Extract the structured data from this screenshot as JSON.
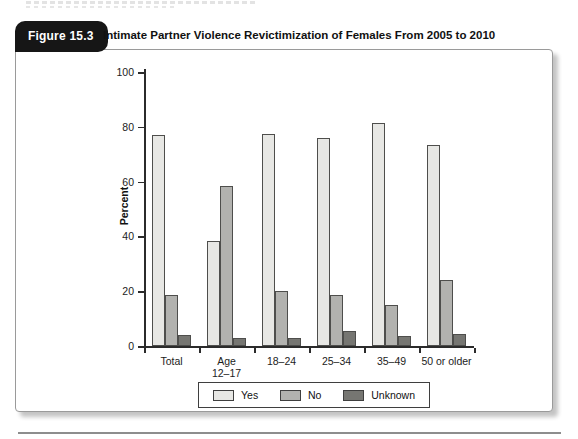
{
  "figure": {
    "label": "Figure 15.3",
    "title": "Intimate Partner Violence Revictimization of Females From 2005 to 2010"
  },
  "chart_data": {
    "type": "bar",
    "title": "Intimate Partner Violence Revictimization of Females From 2005 to 2010",
    "categories": [
      "Total",
      "Age 12–17",
      "18–24",
      "25–34",
      "35–49",
      "50 or older"
    ],
    "category_lines": [
      [
        "Total"
      ],
      [
        "Age",
        "12–17"
      ],
      [
        "18–24"
      ],
      [
        "25–34"
      ],
      [
        "35–49"
      ],
      [
        "50 or older"
      ]
    ],
    "series": [
      {
        "name": "Yes",
        "color": "#e7e7e4",
        "values": [
          77,
          38.5,
          77.5,
          76,
          81.5,
          73.5
        ]
      },
      {
        "name": "No",
        "color": "#b2b2af",
        "values": [
          18.5,
          58.5,
          20,
          18.5,
          15,
          24
        ]
      },
      {
        "name": "Unknown",
        "color": "#767672",
        "values": [
          4,
          3,
          3,
          5.5,
          3.5,
          4.5
        ]
      }
    ],
    "xlabel": "",
    "ylabel": "Percent",
    "ylim": [
      0,
      100
    ],
    "yticks": [
      0,
      20,
      40,
      60,
      80,
      100
    ],
    "grid": false,
    "legend_position": "bottom"
  }
}
